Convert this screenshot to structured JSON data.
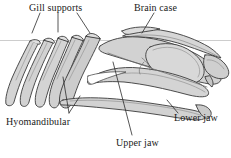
{
  "figure": {
    "type": "anatomical-diagram",
    "background_color": "#ffffff",
    "fill_color": "#d2d2d2",
    "fill_color_light": "#e2e2e2",
    "fill_color_dark": "#bdbdbd",
    "outline_color": "#3a3a3a",
    "leader_color": "#2b2b2b",
    "waterline_color": "#c9c9c9"
  },
  "labels": [
    {
      "id": "gill-supports",
      "text": "Gill supports",
      "x": 29,
      "y": 2
    },
    {
      "id": "brain-case",
      "text": "Brain case",
      "x": 134,
      "y": 2
    },
    {
      "id": "hyomandibular",
      "text": "Hyomandibular",
      "x": 6,
      "y": 116
    },
    {
      "id": "upper-jaw",
      "text": "Upper jaw",
      "x": 116,
      "y": 137
    },
    {
      "id": "lower-jaw",
      "text": "Lower jaw",
      "x": 174,
      "y": 112
    }
  ],
  "parts": [
    {
      "id": "gill-arch-1",
      "name": "Gill arch (first)"
    },
    {
      "id": "gill-arch-2",
      "name": "Gill arch (second)"
    },
    {
      "id": "gill-arch-3",
      "name": "Gill arch (third)"
    },
    {
      "id": "gill-arch-4",
      "name": "Gill arch (fourth)"
    },
    {
      "id": "hyomandibular-bar",
      "name": "Hyomandibular bar"
    },
    {
      "id": "braincase-capsule",
      "name": "Braincase capsule"
    },
    {
      "id": "skull-roof",
      "name": "Skull roof"
    },
    {
      "id": "upper-jaw-element",
      "name": "Upper jaw (palatoquadrate)"
    },
    {
      "id": "lower-jaw-element",
      "name": "Lower jaw (mandible)"
    },
    {
      "id": "snout",
      "name": "Snout / rostrum"
    }
  ],
  "waterline": {
    "y": 40,
    "x_start": 0,
    "x_end": 231
  }
}
